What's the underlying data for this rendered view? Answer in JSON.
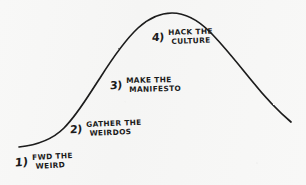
{
  "diagram": {
    "type": "hand-drawn-bell-curve",
    "title_visible": false,
    "ink_color": "#1b1b1b",
    "paper_color": "#f7f7f6",
    "curve": {
      "name": "bell-curve",
      "description": "hand-drawn bell / normal distribution curve rising from lower-left, peaking upper-center, descending to lower-right",
      "start_point": [
        19,
        147
      ],
      "peak_point": [
        170,
        13
      ],
      "end_point": [
        291,
        122
      ],
      "path": "M 19 147 C 38 145, 52 140, 64 128 C 78 114, 88 96, 100 78 C 112 59, 124 41, 138 28 C 150 17, 160 13, 172 13 C 186 13, 198 20, 210 32 C 224 46, 238 64, 252 81 C 264 96, 278 111, 291 122"
    },
    "steps": [
      {
        "number": "1)",
        "number_name": "step-number-1",
        "line1": "FWD THE",
        "line2": "WEIRD",
        "position": "below-left-baseline"
      },
      {
        "number": "2)",
        "number_name": "step-number-2",
        "line1": "GATHER THE",
        "line2": "WEIRDOS",
        "position": "lower-left-flank"
      },
      {
        "number": "3)",
        "number_name": "step-number-3",
        "line1": "MAKE THE",
        "line2": "MANIFESTO",
        "position": "mid-left-flank"
      },
      {
        "number": "4)",
        "number_name": "step-number-4",
        "line1": "HACK THE",
        "line2": "CULTURE",
        "position": "near-peak"
      }
    ]
  }
}
